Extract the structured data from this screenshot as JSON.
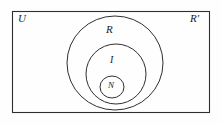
{
  "figure": {
    "type": "euler-diagram",
    "background_color": "#fefefe",
    "stroke_color": "#2b2b2b"
  },
  "labels": {
    "universal_set": "U",
    "irrational_set": "R′",
    "real_set": "R",
    "integer_set": "I",
    "natural_set": "N"
  },
  "shapes": {
    "rectangle": {
      "name": "universal-set-rectangle",
      "x": 12,
      "y": 11,
      "width": 198,
      "height": 102
    },
    "circle_real": {
      "name": "real-numbers-circle",
      "cx": 115,
      "cy": 63,
      "r": 47
    },
    "circle_integers": {
      "name": "integers-circle",
      "cx": 116,
      "cy": 74,
      "r": 30
    },
    "circle_naturals": {
      "name": "natural-numbers-circle",
      "cx": 112,
      "cy": 87,
      "r": 12
    }
  },
  "legend_meaning": {
    "U": "Universal set of all real numbers",
    "R": "Rational numbers",
    "R′": "Irrational numbers (complement of R in U)",
    "I": "Integers",
    "N": "Natural numbers"
  }
}
